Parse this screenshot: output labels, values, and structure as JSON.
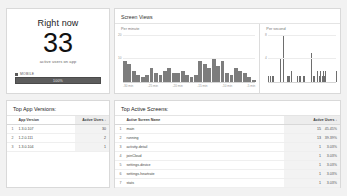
{
  "right_now": {
    "title": "Right now",
    "count": "33",
    "subtitle": "active users on app",
    "legend_label": "MOBILE",
    "bar_label": "100%"
  },
  "charts": {
    "title": "Screen Views",
    "per_minute_label": "Per minute",
    "per_second_label": "Per second"
  },
  "chart_data": [
    {
      "type": "bar",
      "title": "Screen Views",
      "subtitle": "Per minute",
      "xlabel": "",
      "ylabel": "",
      "ylim": [
        0,
        20
      ],
      "yticks": [
        "20",
        "10"
      ],
      "grid": true,
      "legend": "none",
      "xticklabels": [
        "-30 min",
        "-25 min",
        "-20 min",
        "-15 min",
        "-10 min",
        "-5 min"
      ],
      "categories": [
        "-30",
        "-29",
        "-28",
        "-27",
        "-26",
        "-25",
        "-24",
        "-23",
        "-22",
        "-21",
        "-20",
        "-19",
        "-18",
        "-17",
        "-16",
        "-15",
        "-14",
        "-13",
        "-12",
        "-11",
        "-10",
        "-9",
        "-8",
        "-7",
        "-6",
        "-5",
        "-4",
        "-3",
        "-2",
        "-1"
      ],
      "values": [
        9,
        8,
        5,
        3,
        2,
        3,
        6,
        4,
        3,
        5,
        6,
        4,
        4,
        5,
        3,
        2,
        3,
        9,
        8,
        6,
        10,
        7,
        9,
        4,
        3,
        6,
        5,
        4,
        2,
        1
      ]
    },
    {
      "type": "bar",
      "title": "Screen Views",
      "subtitle": "Per second",
      "xlabel": "",
      "ylabel": "",
      "ylim": [
        0,
        8
      ],
      "yticks": [
        "8",
        "4"
      ],
      "grid": true,
      "legend": "none",
      "xticklabels": [],
      "categories": [
        "-60",
        "-59",
        "-58",
        "-57",
        "-56",
        "-55",
        "-54",
        "-53",
        "-52",
        "-51",
        "-50",
        "-49",
        "-48",
        "-47",
        "-46",
        "-45",
        "-44",
        "-43",
        "-42",
        "-41",
        "-40",
        "-39",
        "-38",
        "-37",
        "-36",
        "-35",
        "-34",
        "-33",
        "-32",
        "-31",
        "-30",
        "-29",
        "-28",
        "-27",
        "-26",
        "-25",
        "-24",
        "-23",
        "-22",
        "-21",
        "-20",
        "-19",
        "-18",
        "-17",
        "-16",
        "-15",
        "-14",
        "-13",
        "-12",
        "-11",
        "-10",
        "-9",
        "-8",
        "-7",
        "-6",
        "-5",
        "-4",
        "-3",
        "-2",
        "-1"
      ],
      "values": [
        1,
        1,
        0,
        1,
        1,
        0,
        0,
        0,
        0,
        0,
        4,
        0,
        0,
        8,
        0,
        0,
        1,
        1,
        1,
        0,
        2,
        0,
        0,
        0,
        0,
        1,
        0,
        1,
        1,
        0,
        1,
        1,
        0,
        0,
        0,
        0,
        0,
        5,
        0,
        1,
        1,
        0,
        0,
        2,
        1,
        2,
        0,
        1,
        2,
        1,
        2,
        0,
        0,
        0,
        0,
        0,
        0,
        0,
        0,
        2
      ]
    }
  ],
  "top_app_versions": {
    "title": "Top App Versions:",
    "columns": [
      "App Version",
      "Active Users"
    ],
    "sort_indicator": "↓",
    "rows": [
      {
        "rank": "1",
        "name": "1.3.0.107",
        "users": "30"
      },
      {
        "rank": "2",
        "name": "1.2.0.111",
        "users": "2"
      },
      {
        "rank": "3",
        "name": "1.3.0.104",
        "users": "1"
      }
    ]
  },
  "top_active_screens": {
    "title": "Top Active Screens:",
    "columns": [
      "Active Screen Name",
      "Active Users"
    ],
    "sort_indicator": "↓",
    "rows": [
      {
        "rank": "1",
        "name": "main",
        "users": "15",
        "pct": "45.45%"
      },
      {
        "rank": "2",
        "name": "running",
        "users": "13",
        "pct": "39.39%"
      },
      {
        "rank": "3",
        "name": "activity-detail",
        "users": "1",
        "pct": "3.03%"
      },
      {
        "rank": "4",
        "name": "joinCloud",
        "users": "1",
        "pct": "3.03%"
      },
      {
        "rank": "5",
        "name": "settings-device",
        "users": "1",
        "pct": "3.03%"
      },
      {
        "rank": "6",
        "name": "settings-heartrate",
        "users": "1",
        "pct": "3.03%"
      },
      {
        "rank": "7",
        "name": "stats",
        "users": "1",
        "pct": "3.03%"
      }
    ]
  }
}
